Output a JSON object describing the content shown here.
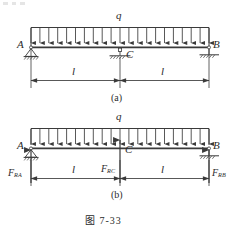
{
  "figure": {
    "caption": "图 7-33",
    "caption_number": "7-33",
    "panels": [
      {
        "id": "a",
        "label": "(a)",
        "title": "Continuous beam with uniformly distributed load",
        "load_label": "q",
        "supports": [
          {
            "name": "A",
            "label": "A",
            "type": "pin"
          },
          {
            "name": "C",
            "label": "C",
            "type": "roller-link"
          },
          {
            "name": "B",
            "label": "B",
            "type": "roller-link"
          }
        ],
        "dimensions": [
          {
            "label": "l",
            "span": "A-C"
          },
          {
            "label": "l",
            "span": "C-B"
          }
        ],
        "load_arrow_count": 21
      },
      {
        "id": "b",
        "label": "(b)",
        "title": "Free body diagram with reactions",
        "load_label": "q",
        "supports": [
          {
            "name": "A",
            "label": "A",
            "type": "pin"
          },
          {
            "name": "C",
            "label": "C",
            "type": "reaction-arrow"
          },
          {
            "name": "B",
            "label": "B",
            "type": "roller-link"
          }
        ],
        "reactions": [
          {
            "name": "F_RA",
            "symbol": "F",
            "subscript": "RA",
            "direction": "up"
          },
          {
            "name": "F_RC",
            "symbol": "F",
            "subscript": "RC",
            "direction": "up"
          },
          {
            "name": "F_RB",
            "symbol": "F",
            "subscript": "RB",
            "direction": "up"
          }
        ],
        "dimensions": [
          {
            "label": "l",
            "span": "A-C"
          },
          {
            "label": "l",
            "span": "C-B"
          }
        ],
        "load_arrow_count": 21
      }
    ],
    "colors": {
      "ink": "#2b2b2b",
      "line": "#3a3a3a",
      "background": "#ffffff"
    }
  }
}
